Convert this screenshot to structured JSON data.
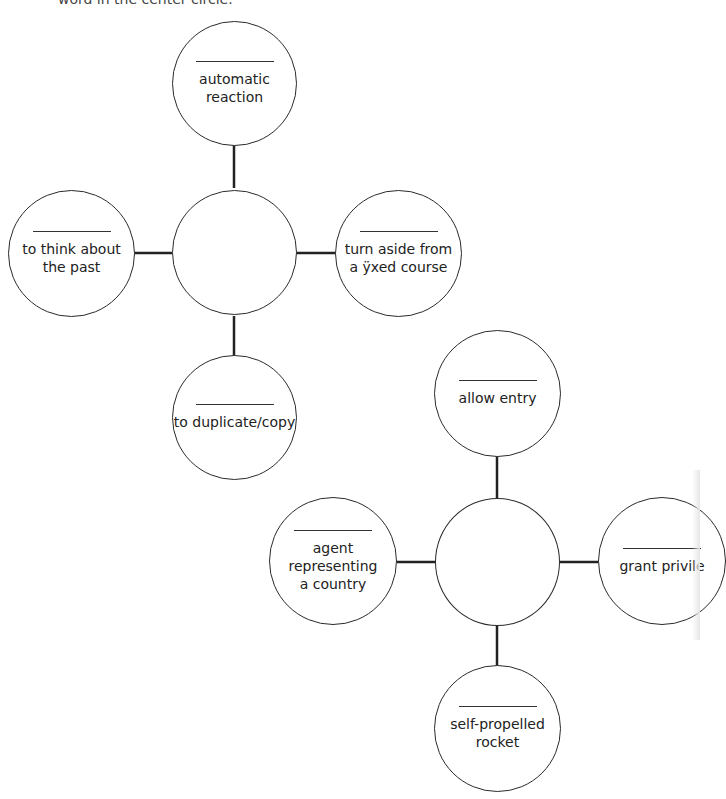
{
  "header": {
    "instruction_fragment": "word in the center circle."
  },
  "maps": [
    {
      "center": {
        "answer": ""
      },
      "spokes": [
        {
          "position": "top",
          "blank": "",
          "clue": "automatic\nreaction"
        },
        {
          "position": "left",
          "blank": "",
          "clue": "to think about\nthe past"
        },
        {
          "position": "right",
          "blank": "",
          "clue": "turn aside from\na ÿxed course"
        },
        {
          "position": "bottom",
          "blank": "",
          "clue": "to duplicate/copy"
        }
      ]
    },
    {
      "center": {
        "answer": ""
      },
      "spokes": [
        {
          "position": "top",
          "blank": "",
          "clue": "allow entry"
        },
        {
          "position": "left",
          "blank": "",
          "clue": "agent representing\na country"
        },
        {
          "position": "right",
          "blank": "",
          "clue": "grant privile"
        },
        {
          "position": "bottom",
          "blank": "",
          "clue": "self-propelled\nrocket"
        }
      ]
    }
  ]
}
